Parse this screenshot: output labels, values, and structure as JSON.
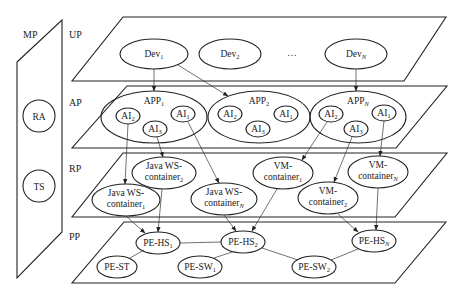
{
  "side_panel": {
    "label": "MP",
    "nodes": [
      {
        "id": "RA",
        "label": "RA"
      },
      {
        "id": "TS",
        "label": "TS"
      }
    ]
  },
  "layers": [
    {
      "id": "UP",
      "label": "UP"
    },
    {
      "id": "AP",
      "label": "AP"
    },
    {
      "id": "RP",
      "label": "RP"
    },
    {
      "id": "PP",
      "label": "PP"
    }
  ],
  "up": {
    "nodes": [
      {
        "id": "dev1",
        "base": "Dev",
        "sub": "1"
      },
      {
        "id": "dev2",
        "base": "Dev",
        "sub": "2"
      },
      {
        "id": "devN",
        "base": "Dev",
        "sub": "N"
      }
    ],
    "ellipsis": "…"
  },
  "ap": {
    "apps": [
      {
        "id": "app1",
        "base": "APP",
        "sub": "1",
        "ais": [
          {
            "base": "AI",
            "sub": "2"
          },
          {
            "base": "AI",
            "sub": "1"
          },
          {
            "base": "AI",
            "sub": "3"
          }
        ]
      },
      {
        "id": "app2",
        "base": "APP",
        "sub": "2",
        "ais": [
          {
            "base": "AI",
            "sub": "2"
          },
          {
            "base": "AI",
            "sub": "1"
          },
          {
            "base": "AI",
            "sub": "3"
          }
        ]
      },
      {
        "id": "appN",
        "base": "APP",
        "sub": "N",
        "ais": [
          {
            "base": "AI",
            "sub": "2"
          },
          {
            "base": "AI",
            "sub": "1"
          },
          {
            "base": "AI",
            "sub": "3"
          }
        ]
      }
    ]
  },
  "rp": {
    "nodes": [
      {
        "id": "jws1",
        "line1": "Java WS-",
        "base": "container",
        "sub": "1"
      },
      {
        "id": "jws2",
        "line1": "Java WS-",
        "base": "container",
        "sub": "2"
      },
      {
        "id": "jwsN",
        "line1": "Java WS-",
        "base": "container",
        "sub": "N"
      },
      {
        "id": "vm1",
        "line1": "VM-",
        "base": "container",
        "sub": "1"
      },
      {
        "id": "vm2",
        "line1": "VM-",
        "base": "container",
        "sub": "2"
      },
      {
        "id": "vmN",
        "line1": "VM-",
        "base": "container",
        "sub": "N"
      }
    ]
  },
  "pp": {
    "nodes": [
      {
        "id": "hs1",
        "base": "PE-HS",
        "sub": "1"
      },
      {
        "id": "hs2",
        "base": "PE-HS",
        "sub": "2"
      },
      {
        "id": "hsN",
        "base": "PE-HS",
        "sub": "N"
      },
      {
        "id": "st",
        "base": "PE-ST",
        "sub": ""
      },
      {
        "id": "sw1",
        "base": "PE-SW",
        "sub": "1"
      },
      {
        "id": "sw2",
        "base": "PE-SW",
        "sub": "2"
      }
    ]
  }
}
